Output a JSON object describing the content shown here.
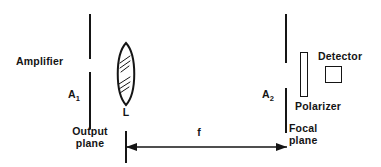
{
  "figure": {
    "type": "optical-setup-diagram",
    "background_color": "#ffffff",
    "ink_color": "#151515"
  },
  "labels": {
    "amplifier": "Amplifier",
    "aperture_1": "A",
    "aperture_1_sub": "1",
    "output_plane_line_1": "Output",
    "output_plane_line_2": "plane",
    "lens": "L",
    "focal_length": "f",
    "aperture_2": "A",
    "aperture_2_sub": "2",
    "focal_plane_line_1": "Focal",
    "focal_plane_line_2": "plane",
    "polarizer": "Polarizer",
    "detector": "Detector"
  },
  "components": {
    "output_plane_aperture": {
      "name": "A1",
      "x": 89,
      "upper_segment": [
        14,
        58
      ],
      "lower_segment": [
        72,
        128
      ]
    },
    "lens": {
      "name": "L",
      "center_x": 126,
      "center_y": 74,
      "half_width": 11,
      "half_height": 31,
      "hatch_groups": 2
    },
    "focal_plane_aperture": {
      "name": "A2",
      "x": 285,
      "upper_segment": [
        14,
        62
      ],
      "lower_segment": [
        88,
        132
      ]
    },
    "polarizer": {
      "x": 300,
      "y": 52,
      "width": 8,
      "height": 45
    },
    "detector": {
      "x": 325,
      "y": 66,
      "width": 17,
      "height": 17
    },
    "focal_length_arrow": {
      "y": 147,
      "x_start": 126,
      "x_end": 287,
      "tick_top": 131,
      "tick_bottom": 163,
      "double_headed": true
    }
  }
}
